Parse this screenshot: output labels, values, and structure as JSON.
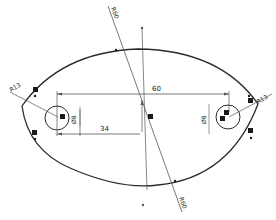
{
  "drawing": {
    "colors": {
      "background": "#ffffff",
      "outline": "#2a2a2a",
      "dim_line": "#555555",
      "marker": "#1a1a1a"
    },
    "labels": {
      "radius_top": "R60",
      "radius_bottom": "R60",
      "radius_left": "R13",
      "radius_right": "R13",
      "dim_width": "60",
      "dim_offset": "34",
      "dia_left": "Ø8",
      "dia_right": "Ø8"
    }
  }
}
